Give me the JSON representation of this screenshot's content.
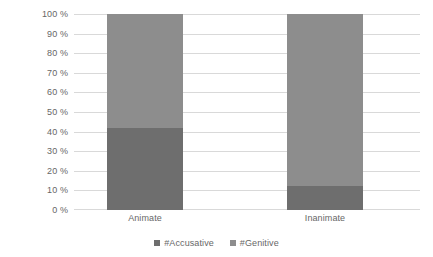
{
  "chart_data": {
    "type": "bar",
    "subtype": "stacked-100-percent",
    "title": "",
    "subtitle": "",
    "xlabel": "",
    "ylabel": "",
    "categories": [
      "Animate",
      "Inanimate"
    ],
    "series": [
      {
        "name": "#Accusative",
        "values": [
          42,
          12
        ],
        "color": "#6e6e6e"
      },
      {
        "name": "#Genitive",
        "values": [
          58,
          88
        ],
        "color": "#8d8d8d"
      }
    ],
    "ylim": [
      0,
      100
    ],
    "y_tick_values": [
      0,
      10,
      20,
      30,
      40,
      50,
      60,
      70,
      80,
      90,
      100
    ],
    "y_tick_labels": [
      "0 %",
      "10 %",
      "20 %",
      "30 %",
      "40 %",
      "50 %",
      "60 %",
      "70 %",
      "80 %",
      "90 %",
      "100 %"
    ],
    "grid": true,
    "legend_position": "bottom",
    "legend_entries": [
      "#Accusative",
      "#Genitive"
    ],
    "annotations": []
  },
  "colors": {
    "background": "#ffffff",
    "gridline": "#d9d9d9",
    "text": "#676767",
    "accusative": "#6e6e6e",
    "genitive": "#8d8d8d"
  }
}
